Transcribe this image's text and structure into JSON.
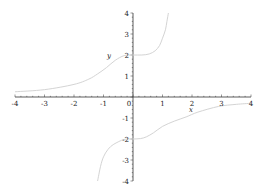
{
  "chart_data": {
    "type": "line",
    "title": "",
    "xlabel": "x",
    "ylabel": "y",
    "xlim": [
      -4,
      4
    ],
    "ylim": [
      -4,
      4
    ],
    "grid": false,
    "legend": null,
    "x_ticks": [
      -4,
      -3,
      -2,
      -1,
      0,
      1,
      2,
      3,
      4
    ],
    "y_ticks": [
      -4,
      -3,
      -2,
      -1,
      1,
      2,
      3,
      4
    ],
    "x_tick_labels": [
      "-4",
      "-3",
      "-2",
      "-1",
      "0",
      "1",
      "2",
      "3",
      "4"
    ],
    "y_tick_labels": [
      "-4",
      "-3",
      "-2",
      "-1",
      "1",
      "2",
      "3",
      "4"
    ],
    "series": [
      {
        "name": "upper branch",
        "color": "#d4d4d4",
        "points": [
          [
            -4.0,
            0.25
          ],
          [
            -3.0,
            0.35
          ],
          [
            -2.0,
            0.6
          ],
          [
            -1.5,
            0.85
          ],
          [
            -1.2,
            1.1
          ],
          [
            -0.9,
            1.4
          ],
          [
            -0.6,
            1.75
          ],
          [
            -0.3,
            1.97
          ],
          [
            0.0,
            2.0
          ],
          [
            0.3,
            2.0
          ],
          [
            0.55,
            2.05
          ],
          [
            0.75,
            2.2
          ],
          [
            0.9,
            2.45
          ],
          [
            1.0,
            2.8
          ],
          [
            1.1,
            3.2
          ],
          [
            1.15,
            3.6
          ],
          [
            1.2,
            4.0
          ]
        ]
      },
      {
        "name": "lower branch",
        "color": "#d4d4d4",
        "points": [
          [
            -1.2,
            -4.0
          ],
          [
            -1.1,
            -3.3
          ],
          [
            -1.0,
            -2.85
          ],
          [
            -0.85,
            -2.5
          ],
          [
            -0.65,
            -2.25
          ],
          [
            -0.3,
            -2.02
          ],
          [
            0.0,
            -2.0
          ],
          [
            0.25,
            -1.98
          ],
          [
            0.45,
            -1.9
          ],
          [
            0.7,
            -1.7
          ],
          [
            1.0,
            -1.4
          ],
          [
            1.4,
            -1.15
          ],
          [
            1.8,
            -0.95
          ],
          [
            2.2,
            -0.72
          ],
          [
            2.9,
            -0.45
          ],
          [
            3.5,
            -0.35
          ],
          [
            4.0,
            -0.3
          ]
        ]
      }
    ]
  },
  "labels": {
    "x_axis": "x",
    "y_axis": "y"
  },
  "colors": {
    "axis": "#333333",
    "curve": "#d4d4d4",
    "background": "#ffffff"
  }
}
